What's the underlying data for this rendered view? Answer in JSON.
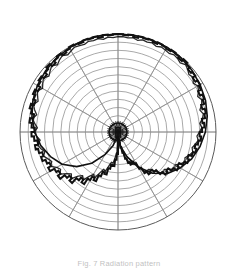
{
  "figure": {
    "kind": "polar-radiation-pattern",
    "title": "",
    "caption": "Fig. 7  Radiation pattern",
    "background_color": "#ffffff",
    "grid_color": "#8c8c8c",
    "outer_circle_color": "#5a5a5a",
    "trace_color": "#111111",
    "center_x": 118,
    "center_y": 132,
    "outer_radius": 98
  },
  "chart_data": {
    "type": "line",
    "polar": true,
    "title": "Radiation pattern",
    "xlabel": "Angle (deg)",
    "ylabel": "Relative level (dB)",
    "angle_unit": "degrees",
    "angle_zero_at": "bottom",
    "angle_direction": "clockwise",
    "rlim": [
      0,
      12
    ],
    "r_grid_rings": 12,
    "r_gridline_values": [
      1,
      2,
      3,
      4,
      5,
      6,
      7,
      8,
      9,
      10,
      11,
      12
    ],
    "theta_gridline_values": [
      0,
      30,
      60,
      90,
      120,
      150,
      180,
      210,
      240,
      270,
      300,
      330
    ],
    "grid": true,
    "legend": false,
    "legend_position": "none",
    "series": [
      {
        "name": "Measured pattern",
        "note": "Noisy quantized trace; near-maximum level over most angles, deep narrow null toward boresight (bottom).",
        "theta": [
          0,
          3,
          6,
          9,
          12,
          15,
          18,
          21,
          24,
          27,
          30,
          33,
          36,
          39,
          42,
          45,
          48,
          51,
          54,
          57,
          60,
          63,
          66,
          69,
          72,
          75,
          78,
          81,
          84,
          87,
          90,
          93,
          96,
          99,
          102,
          105,
          108,
          111,
          114,
          117,
          120,
          123,
          126,
          129,
          132,
          135,
          138,
          141,
          144,
          147,
          150,
          153,
          156,
          159,
          162,
          165,
          168,
          171,
          174,
          177,
          180,
          183,
          186,
          189,
          192,
          195,
          198,
          201,
          204,
          207,
          210,
          213,
          216,
          219,
          222,
          225,
          228,
          231,
          234,
          237,
          240,
          243,
          246,
          249,
          252,
          255,
          258,
          261,
          264,
          267,
          270,
          273,
          276,
          279,
          282,
          285,
          288,
          291,
          294,
          297,
          300,
          303,
          306,
          309,
          312,
          315,
          318,
          321,
          324,
          327,
          330,
          333,
          336,
          339,
          342,
          345,
          348,
          351,
          354,
          357
        ],
        "r": [
          0.6,
          0.9,
          1.3,
          1.9,
          2.6,
          3.4,
          4.0,
          4.3,
          4.1,
          4.4,
          5.2,
          6.0,
          6.4,
          6.2,
          6.6,
          7.3,
          7.8,
          7.6,
          8.1,
          8.6,
          8.4,
          8.9,
          9.3,
          9.1,
          9.5,
          9.8,
          9.6,
          9.9,
          10.2,
          10.0,
          10.3,
          10.6,
          10.4,
          10.8,
          11.0,
          10.7,
          11.1,
          11.3,
          11.0,
          11.4,
          11.6,
          11.3,
          11.7,
          11.5,
          11.8,
          12.0,
          11.7,
          11.9,
          12.0,
          11.8,
          11.9,
          12.0,
          11.8,
          12.0,
          11.9,
          12.0,
          11.8,
          12.0,
          11.9,
          12.0,
          12.0,
          11.9,
          12.0,
          11.8,
          12.0,
          11.9,
          12.0,
          11.8,
          11.9,
          12.0,
          11.8,
          11.6,
          11.9,
          11.7,
          11.4,
          11.8,
          11.5,
          11.2,
          11.6,
          11.3,
          11.0,
          11.4,
          11.1,
          10.8,
          11.2,
          10.9,
          10.5,
          10.9,
          10.6,
          10.2,
          10.6,
          10.3,
          9.9,
          10.3,
          10.0,
          9.6,
          9.9,
          9.5,
          9.2,
          9.6,
          9.0,
          8.7,
          9.1,
          8.4,
          8.0,
          8.4,
          7.6,
          7.2,
          7.6,
          6.8,
          6.3,
          6.6,
          5.8,
          5.2,
          5.4,
          4.6,
          4.1,
          4.2,
          3.4,
          2.7,
          2.0,
          1.3
        ]
      },
      {
        "name": "Smoothed envelope",
        "note": "Overlaid smooth lobe curves crossing near the centre, forming the two leaf-shaped main-beam outlines.",
        "theta": [
          0,
          10,
          20,
          30,
          40,
          50,
          60,
          70,
          80,
          90,
          100,
          110,
          120,
          130,
          140,
          150,
          160,
          170,
          180,
          190,
          200,
          210,
          220,
          230,
          240,
          250,
          260,
          270,
          280,
          290,
          300,
          310,
          320,
          330,
          340,
          350
        ],
        "r": [
          0.5,
          1.8,
          3.2,
          5.0,
          6.6,
          7.9,
          8.8,
          9.6,
          10.2,
          10.7,
          11.1,
          11.4,
          11.6,
          11.8,
          11.9,
          12.0,
          12.0,
          12.0,
          12.0,
          12.0,
          12.0,
          11.9,
          11.8,
          11.6,
          11.4,
          11.1,
          10.7,
          10.2,
          9.6,
          8.8,
          7.9,
          6.6,
          5.0,
          3.2,
          1.8,
          0.5
        ]
      }
    ]
  }
}
